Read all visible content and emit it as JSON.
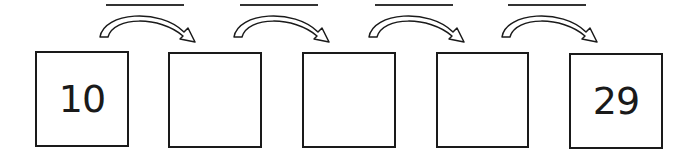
{
  "diagram": {
    "title": "",
    "boxes": [
      {
        "value": "10"
      },
      {
        "value": ""
      },
      {
        "value": ""
      },
      {
        "value": ""
      },
      {
        "value": "29"
      }
    ],
    "step_blanks": [
      {
        "value": ""
      },
      {
        "value": ""
      },
      {
        "value": ""
      },
      {
        "value": ""
      }
    ],
    "colors": {
      "stroke": "#1a1a1a",
      "background": "#ffffff"
    }
  }
}
